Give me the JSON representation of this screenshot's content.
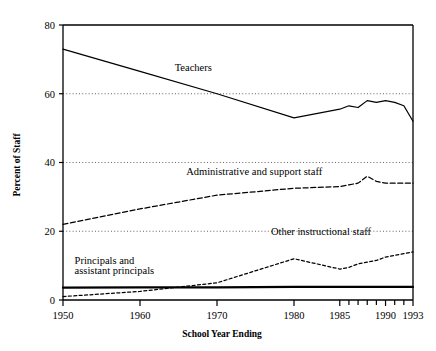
{
  "chart_data": {
    "type": "line",
    "title": "",
    "xlabel": "School Year Ending",
    "ylabel": "Percent of Staff",
    "ylim": [
      0,
      80
    ],
    "yticks": [
      0,
      20,
      40,
      60,
      80
    ],
    "ytick_labels": [
      "0",
      "20",
      "40",
      "60",
      "80"
    ],
    "xticks": [
      1950,
      1960,
      1970,
      1980,
      1985,
      1986,
      1987,
      1988,
      1989,
      1990,
      1991,
      1992,
      1993
    ],
    "xtick_labels": [
      "1950",
      "1960",
      "1970",
      "1980",
      "1985",
      "1990",
      "1993"
    ],
    "xtick_labeled_years": [
      1950,
      1960,
      1970,
      1980,
      1985,
      1990,
      1993
    ],
    "grid": "horizontal-dotted-at-20-40-60",
    "legend": "inline-annotations",
    "x": [
      1950,
      1960,
      1970,
      1980,
      1985,
      1986,
      1987,
      1988,
      1989,
      1990,
      1991,
      1992,
      1993
    ],
    "series": [
      {
        "name": "Teachers",
        "style": "solid",
        "label_x": 1964.5,
        "label_y": 66.5,
        "values": [
          73.0,
          66.5,
          60.0,
          53.0,
          55.5,
          56.5,
          56.0,
          58.0,
          57.5,
          58.0,
          57.5,
          56.5,
          52.0
        ]
      },
      {
        "name": "Administrative and support staff",
        "style": "dashed",
        "label_x": 1966.0,
        "label_y": 36.5,
        "values": [
          22.0,
          26.5,
          30.5,
          32.5,
          33.0,
          33.5,
          34.0,
          36.0,
          34.5,
          34.0,
          34.0,
          34.0,
          34.0
        ]
      },
      {
        "name": "Other instructional staff",
        "style": "fine-dashed",
        "label_x": 1977.0,
        "label_y": 19.0,
        "values": [
          1.0,
          2.5,
          5.0,
          12.0,
          9.0,
          9.5,
          10.5,
          11.0,
          11.5,
          12.5,
          13.0,
          13.5,
          14.0
        ]
      },
      {
        "name": "Principals and assistant principals",
        "style": "solid-thick",
        "label_x": 1951.5,
        "label_y": 10.5,
        "label_line2_y": 7.5,
        "values": [
          3.6,
          3.7,
          3.7,
          3.8,
          3.8,
          3.8,
          3.8,
          3.8,
          3.8,
          3.8,
          3.8,
          3.8,
          3.8
        ]
      }
    ],
    "series_label_lines": {
      "principals_line1": "Principals and",
      "principals_line2": "assistant principals"
    },
    "colors": {
      "axis": "#000000",
      "line": "#000000",
      "grid": "#555555",
      "background": "#ffffff"
    }
  }
}
